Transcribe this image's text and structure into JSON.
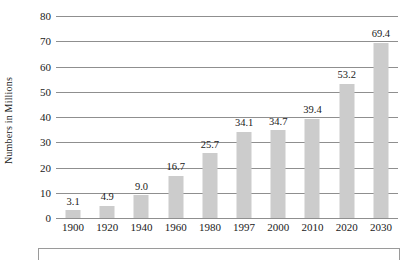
{
  "chart_data": {
    "type": "bar",
    "title": "",
    "xlabel": "",
    "ylabel": "Numbers in Millions",
    "categories": [
      "1900",
      "1920",
      "1940",
      "1960",
      "1980",
      "1997",
      "2000",
      "2010",
      "2020",
      "2030"
    ],
    "values": [
      3.1,
      4.9,
      9.0,
      16.7,
      25.7,
      34.1,
      34.7,
      39.4,
      53.2,
      69.4
    ],
    "value_labels": [
      "3.1",
      "4.9",
      "9.0",
      "16.7",
      "25.7",
      "34.1",
      "34.7",
      "39.4",
      "53.2",
      "69.4"
    ],
    "ylim": [
      0,
      80
    ],
    "yticks": [
      0,
      10,
      20,
      30,
      40,
      50,
      60,
      70,
      80
    ],
    "ytick_labels": [
      "0",
      "10",
      "20",
      "30",
      "40",
      "50",
      "60",
      "70",
      "80"
    ],
    "grid": true,
    "legend": null,
    "bar_color": "#cccccc",
    "gridline_color": "#8f8f8f",
    "background_color": "#ffffff",
    "text_color": "#1a1a1a"
  }
}
